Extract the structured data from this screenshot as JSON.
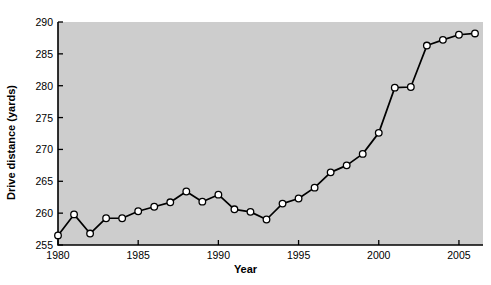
{
  "chart_data": {
    "type": "line",
    "title": "",
    "xlabel": "Year",
    "ylabel": "Drive distance (yards)",
    "xlim": [
      1980,
      2006.5
    ],
    "ylim": [
      255,
      290
    ],
    "xticks": [
      1980,
      1985,
      1990,
      1995,
      2000,
      2005
    ],
    "xtick_labels": [
      "1980",
      "1985",
      "1990",
      "1995",
      "2000",
      "2005"
    ],
    "yticks": [
      255,
      260,
      265,
      270,
      275,
      280,
      285,
      290
    ],
    "ytick_labels": [
      "255",
      "260",
      "265",
      "270",
      "275",
      "280",
      "285",
      "290"
    ],
    "grid": false,
    "legend": null,
    "x": [
      1980,
      1981,
      1982,
      1983,
      1984,
      1985,
      1986,
      1987,
      1988,
      1989,
      1990,
      1991,
      1992,
      1993,
      1994,
      1995,
      1996,
      1997,
      1998,
      1999,
      2000,
      2001,
      2002,
      2003,
      2004,
      2005,
      2006
    ],
    "values": [
      256.5,
      259.8,
      256.8,
      259.2,
      259.2,
      260.3,
      261.0,
      261.7,
      263.4,
      261.8,
      262.9,
      260.6,
      260.2,
      259.0,
      261.5,
      262.3,
      264.0,
      266.4,
      267.5,
      269.3,
      272.6,
      279.7,
      279.8,
      286.3,
      287.2,
      288.0,
      288.2
    ],
    "series_name": "Drive distance",
    "marker": "circle",
    "marker_face_color": "#ffffff",
    "marker_edge_color": "#000000",
    "line_color": "#000000",
    "plot_background": "#cdcdcd",
    "figure_background": "#ffffff"
  }
}
